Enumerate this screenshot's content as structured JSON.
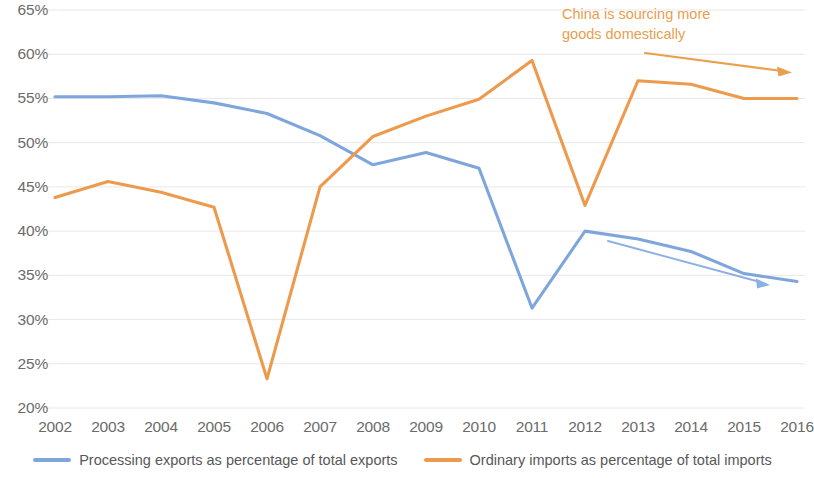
{
  "chart_data": {
    "type": "line",
    "title": "",
    "xlabel": "",
    "ylabel": "",
    "grid": true,
    "legend_position": "bottom",
    "ylim": [
      20,
      65
    ],
    "ytick_labels": [
      "65%",
      "60%",
      "55%",
      "50%",
      "45%",
      "40%",
      "35%",
      "30%",
      "25%",
      "20%"
    ],
    "ytick_values": [
      65,
      60,
      55,
      50,
      45,
      40,
      35,
      30,
      25,
      20
    ],
    "categories": [
      "2002",
      "2003",
      "2004",
      "2005",
      "2006",
      "2007",
      "2008",
      "2009",
      "2010",
      "2011",
      "2012",
      "2013",
      "2014",
      "2015",
      "2016"
    ],
    "series": [
      {
        "name": "Processing exports as percentage of total exports",
        "color": "#7FA6DC",
        "values": [
          55.2,
          55.2,
          55.3,
          54.5,
          53.3,
          50.8,
          47.5,
          48.9,
          47.1,
          31.3,
          40.0,
          39.1,
          37.7,
          35.2,
          34.3
        ]
      },
      {
        "name": "Ordinary imports as percentage of total imports",
        "color": "#ED9A4C",
        "values": [
          43.8,
          45.6,
          44.4,
          42.7,
          23.3,
          45.0,
          50.7,
          53.0,
          54.9,
          59.3,
          42.9,
          57.0,
          56.6,
          55.0,
          55.0
        ]
      }
    ],
    "annotations": [
      {
        "id": "sourcing-note",
        "text_line_1": "China is sourcing more",
        "text_line_2": "goods domestically",
        "color": "#E8A04E"
      }
    ]
  },
  "legend": {
    "items": [
      {
        "label": "Processing exports as percentage of total exports",
        "color": "#7FA6DC"
      },
      {
        "label": "Ordinary imports as percentage of total imports",
        "color": "#ED9A4C"
      }
    ]
  },
  "colors": {
    "blue_series": "#7FA6DC",
    "orange_series": "#ED9A4C",
    "annotation_orange": "#E8A04E",
    "annotation_blue": "#7FA6DC",
    "gridline": "#E8E8E8",
    "tick_text": "#6b6b6b"
  }
}
